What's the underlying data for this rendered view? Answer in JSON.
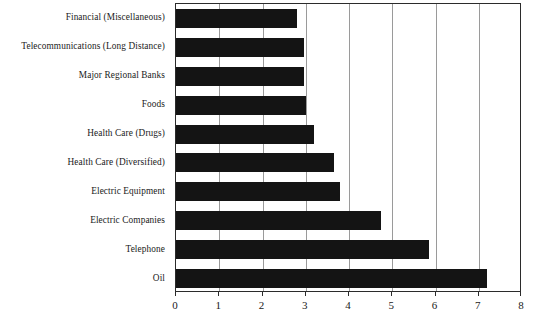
{
  "chart_data": {
    "type": "bar",
    "orientation": "horizontal",
    "title": "",
    "subtitle": "",
    "xlabel": "",
    "ylabel": "",
    "xlim": [
      0,
      8
    ],
    "xticks": [
      "0",
      "1",
      "2",
      "3",
      "4",
      "5",
      "6",
      "7",
      "8"
    ],
    "grid": "vertical-only",
    "legend": "none",
    "bar_color": "#141414",
    "axis_color": "#2b2b2b",
    "gridline_color": "#9a9a9a",
    "categories": [
      "Financial (Miscellaneous)",
      "Telecommunications (Long Distance)",
      "Major Regional Banks",
      "Foods",
      "Health Care (Drugs)",
      "Health Care (Diversified)",
      "Electric Equipment",
      "Electric Companies",
      "Telephone",
      "Oil"
    ],
    "values": [
      2.8,
      2.95,
      2.95,
      3.0,
      3.2,
      3.65,
      3.8,
      4.75,
      5.85,
      7.2
    ]
  }
}
